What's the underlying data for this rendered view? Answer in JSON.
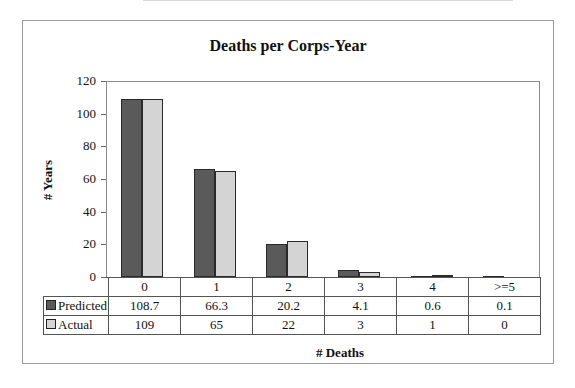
{
  "chart_data": {
    "type": "bar",
    "title": "Deaths per Corps-Year",
    "xlabel": "# Deaths",
    "ylabel": "# Years",
    "ylim": [
      0,
      120
    ],
    "yticks": [
      0,
      20,
      40,
      60,
      80,
      100,
      120
    ],
    "categories": [
      "0",
      "1",
      "2",
      "3",
      "4",
      ">=5"
    ],
    "series": [
      {
        "name": "Predicted",
        "color": "#5a5a5a",
        "values": [
          108.7,
          66.3,
          20.2,
          4.1,
          0.6,
          0.1
        ],
        "labels": [
          "108.7",
          "66.3",
          "20.2",
          "4.1",
          "0.6",
          "0.1"
        ]
      },
      {
        "name": "Actual",
        "color": "#d4d4d4",
        "values": [
          109,
          65,
          22,
          3,
          1,
          0
        ],
        "labels": [
          "109",
          "65",
          "22",
          "3",
          "1",
          "0"
        ]
      }
    ],
    "legend_position": "data-table",
    "grid": false
  }
}
